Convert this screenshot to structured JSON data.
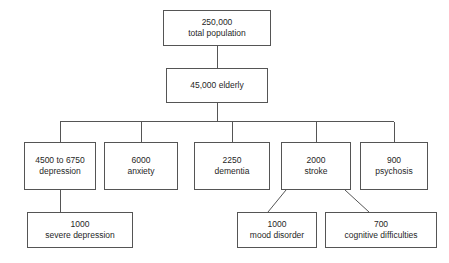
{
  "diagram": {
    "type": "flowchart-tree",
    "orientation": "top-down",
    "background_color": "#ffffff",
    "box_border_color": "#555555",
    "text_color": "#1f1f1f",
    "connector_color": "#555555",
    "nodes": [
      {
        "id": "total-population",
        "count": "250,000",
        "label": "total population",
        "level": 0,
        "x": 163,
        "y": 10,
        "w": 108,
        "h": 36
      },
      {
        "id": "elderly",
        "count": "45,000 elderly",
        "label": "",
        "level": 1,
        "x": 166,
        "y": 68,
        "w": 102,
        "h": 35
      },
      {
        "id": "depression",
        "count": "4500 to 6750",
        "label": "depression",
        "level": 2,
        "x": 24,
        "y": 142,
        "w": 72,
        "h": 48
      },
      {
        "id": "anxiety",
        "count": "6000",
        "label": "anxiety",
        "level": 2,
        "x": 104,
        "y": 142,
        "w": 74,
        "h": 48
      },
      {
        "id": "dementia",
        "count": "2250",
        "label": "dementia",
        "level": 2,
        "x": 194,
        "y": 142,
        "w": 76,
        "h": 48
      },
      {
        "id": "stroke",
        "count": "2000",
        "label": "stroke",
        "level": 2,
        "x": 281,
        "y": 142,
        "w": 70,
        "h": 48
      },
      {
        "id": "psychosis",
        "count": "900",
        "label": "psychosis",
        "level": 2,
        "x": 360,
        "y": 142,
        "w": 68,
        "h": 48
      },
      {
        "id": "severe-depression",
        "count": "1000",
        "label": "severe depression",
        "level": 3,
        "x": 27,
        "y": 212,
        "w": 106,
        "h": 36
      },
      {
        "id": "mood-disorder",
        "count": "1000",
        "label": "mood disorder",
        "level": 3,
        "x": 237,
        "y": 212,
        "w": 80,
        "h": 36
      },
      {
        "id": "cognitive-difficulties",
        "count": "700",
        "label": "cognitive difficulties",
        "level": 3,
        "x": 325,
        "y": 212,
        "w": 112,
        "h": 36
      }
    ],
    "edges": [
      {
        "from": "total-population",
        "to": "elderly",
        "style": "straight-vertical"
      },
      {
        "from": "elderly",
        "to": "depression",
        "style": "orthogonal-bus"
      },
      {
        "from": "elderly",
        "to": "anxiety",
        "style": "orthogonal-bus"
      },
      {
        "from": "elderly",
        "to": "dementia",
        "style": "orthogonal-bus"
      },
      {
        "from": "elderly",
        "to": "stroke",
        "style": "orthogonal-bus"
      },
      {
        "from": "elderly",
        "to": "psychosis",
        "style": "orthogonal-bus"
      },
      {
        "from": "depression",
        "to": "severe-depression",
        "style": "straight-vertical"
      },
      {
        "from": "stroke",
        "to": "mood-disorder",
        "style": "diagonal"
      },
      {
        "from": "stroke",
        "to": "cognitive-difficulties",
        "style": "diagonal"
      }
    ]
  }
}
